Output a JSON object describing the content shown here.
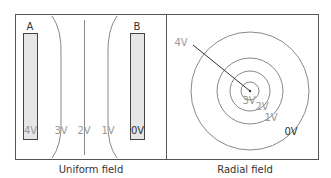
{
  "uniform": {
    "caption": "Uniform field",
    "plate_a_label": "A",
    "plate_b_label": "B",
    "potentials": [
      "4V",
      "3V",
      "2V",
      "1V",
      "0V"
    ]
  },
  "radial": {
    "caption": "Radial field",
    "labels": {
      "outer_arrow": "4V",
      "r3": "3V",
      "r2": "2V",
      "r1": "1V",
      "r0": "0V"
    }
  },
  "colors": {
    "border": "#555555",
    "plate_fill": "#e6e6e6",
    "line": "#888888",
    "label_faint": "#999999",
    "label_dark": "#333333"
  }
}
